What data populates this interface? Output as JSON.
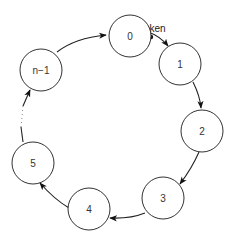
{
  "diagram": {
    "token_label": "Token",
    "nodes": [
      {
        "id": "0",
        "label": "0",
        "cx": 130,
        "cy": 36
      },
      {
        "id": "1",
        "label": "1",
        "cx": 180,
        "cy": 64
      },
      {
        "id": "2",
        "label": "2",
        "cx": 202,
        "cy": 131
      },
      {
        "id": "3",
        "label": "3",
        "cx": 163,
        "cy": 198
      },
      {
        "id": "4",
        "label": "4",
        "cx": 89,
        "cy": 209
      },
      {
        "id": "5",
        "label": "5",
        "cx": 33,
        "cy": 163
      },
      {
        "id": "n-1",
        "label": "n−1",
        "cx": 41,
        "cy": 70
      }
    ],
    "edges": [
      {
        "from": "0",
        "to": "1",
        "style": "solid",
        "carries_token": true
      },
      {
        "from": "1",
        "to": "2",
        "style": "solid"
      },
      {
        "from": "2",
        "to": "3",
        "style": "solid"
      },
      {
        "from": "3",
        "to": "4",
        "style": "solid"
      },
      {
        "from": "4",
        "to": "5",
        "style": "solid"
      },
      {
        "from": "5",
        "to": "n-1",
        "style": "dotted"
      },
      {
        "from": "n-1",
        "to": "0",
        "style": "solid"
      }
    ],
    "colors": {
      "stroke": "#333333",
      "background": "#ffffff",
      "token": "#111111"
    }
  }
}
